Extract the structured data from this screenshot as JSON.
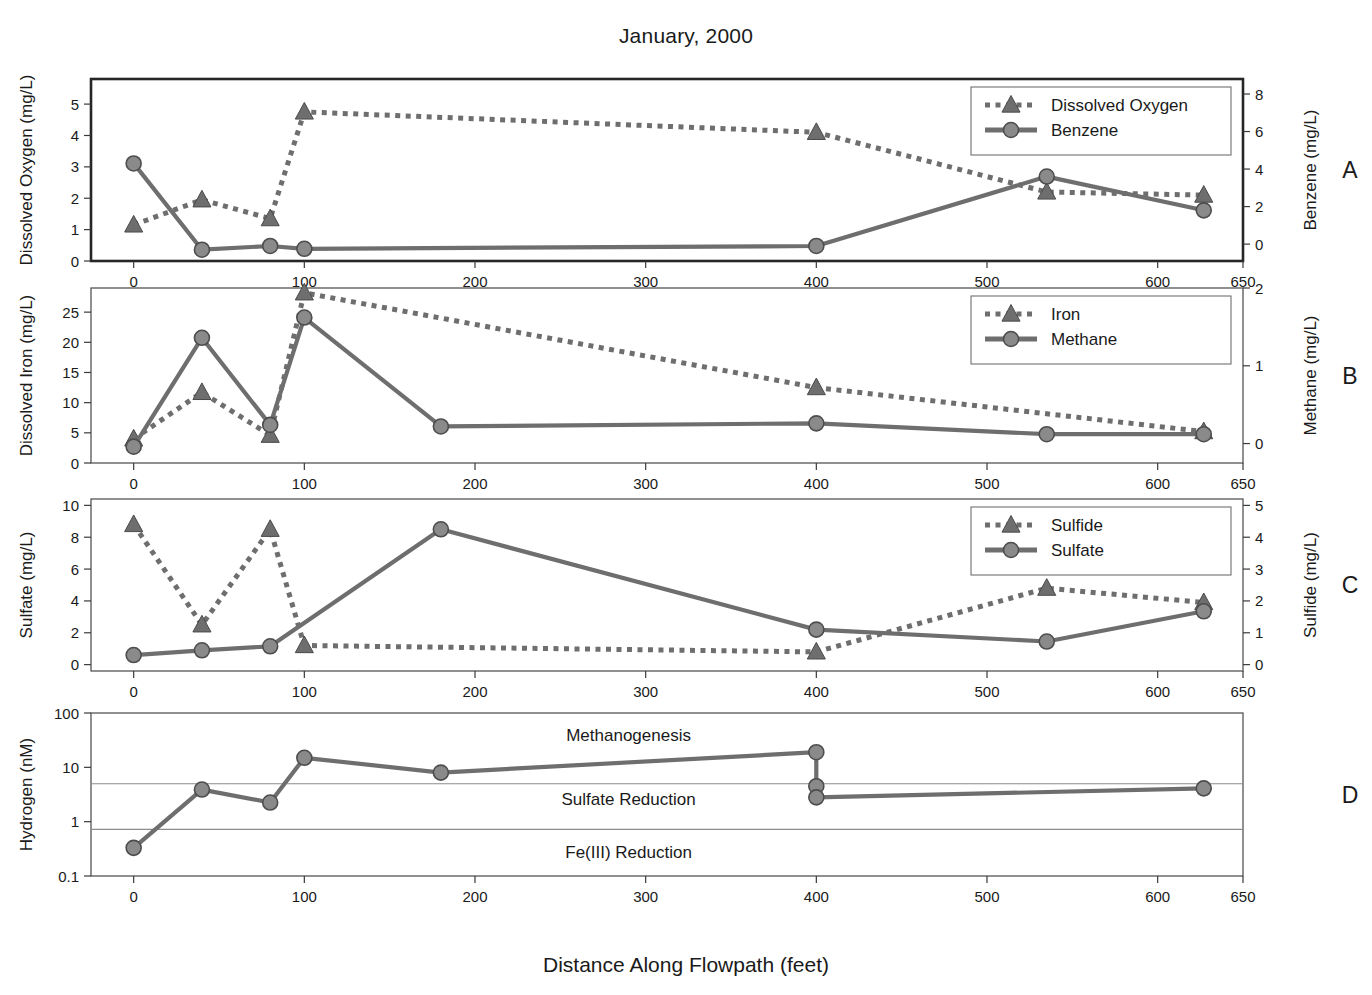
{
  "title": "January, 2000",
  "xaxis_title": "Distance Along Flowpath (feet)",
  "colors": {
    "series_gray": "#6e6e6e",
    "marker_fill": "#8a8a8a",
    "axis": "#3a3a3a",
    "frame": "#555555",
    "text": "#1a1a1a"
  },
  "x_ticks": [
    0,
    100,
    200,
    300,
    400,
    500,
    600,
    650
  ],
  "x_range": [
    -25,
    650
  ],
  "panels": [
    {
      "letter": "A",
      "left_axis_title": "Dissolved Oxygen (mg/L)",
      "right_axis_title": "Benzene (mg/L)",
      "left_ticks": [
        0,
        1,
        2,
        3,
        4,
        5
      ],
      "right_ticks": [
        0,
        2,
        4,
        6,
        8
      ],
      "legend": [
        {
          "label": "Dissolved Oxygen",
          "style": "dotted-triangle"
        },
        {
          "label": "Benzene",
          "style": "solid-circle"
        }
      ]
    },
    {
      "letter": "B",
      "left_axis_title": "Dissolved Iron (mg/L)",
      "right_axis_title": "Methane (mg/L)",
      "left_ticks": [
        0,
        5,
        10,
        15,
        20,
        25
      ],
      "right_ticks": [
        0,
        1,
        2
      ],
      "legend": [
        {
          "label": "Iron",
          "style": "dotted-triangle"
        },
        {
          "label": "Methane",
          "style": "solid-circle"
        }
      ]
    },
    {
      "letter": "C",
      "left_axis_title": "Sulfate (mg/L)",
      "right_axis_title": "Sulfide (mg/L)",
      "left_ticks": [
        0,
        2,
        4,
        6,
        8,
        10
      ],
      "right_ticks": [
        0,
        1,
        2,
        3,
        4,
        5
      ],
      "legend": [
        {
          "label": "Sulfide",
          "style": "dotted-triangle"
        },
        {
          "label": "Sulfate",
          "style": "solid-circle"
        }
      ]
    },
    {
      "letter": "D",
      "left_axis_title": "Hydrogen (nM)",
      "right_axis_title": "",
      "left_ticks": [
        0.1,
        1,
        10,
        100
      ],
      "right_ticks": [],
      "legend": [],
      "zone_labels": [
        {
          "text": "Methanogenesis",
          "x": 290,
          "y_value": 40
        },
        {
          "text": "Sulfate Reduction",
          "x": 290,
          "y_value": 2.6
        },
        {
          "text": "Fe(III) Reduction",
          "x": 290,
          "y_value": 0.28
        }
      ],
      "zone_lines": [
        5.0,
        0.72
      ]
    }
  ],
  "chart_data": [
    {
      "type": "line",
      "panel": "A",
      "title": "January, 2000",
      "xlabel": "Distance Along Flowpath (feet)",
      "ylabel": "Dissolved Oxygen (mg/L)",
      "y2label": "Benzene (mg/L)",
      "xlim": [
        -25,
        650
      ],
      "ylim": [
        0,
        5.8
      ],
      "y2lim": [
        -0.9,
        8.8
      ],
      "grid": false,
      "legend_position": "top-right",
      "series": [
        {
          "name": "Dissolved Oxygen",
          "axis": "left",
          "style": "dotted",
          "marker": "triangle",
          "x": [
            0,
            40,
            80,
            100,
            400,
            535,
            627
          ],
          "values": [
            1.15,
            1.95,
            1.35,
            4.75,
            4.1,
            2.2,
            2.1
          ]
        },
        {
          "name": "Benzene",
          "axis": "right",
          "style": "solid",
          "marker": "circle",
          "x": [
            0,
            40,
            80,
            100,
            400,
            535,
            627
          ],
          "values": [
            4.3,
            -0.3,
            -0.1,
            -0.25,
            -0.1,
            3.6,
            1.8
          ]
        }
      ]
    },
    {
      "type": "line",
      "panel": "B",
      "xlabel": "Distance Along Flowpath (feet)",
      "ylabel": "Dissolved Iron (mg/L)",
      "y2label": "Methane (mg/L)",
      "xlim": [
        -25,
        650
      ],
      "ylim": [
        0,
        29
      ],
      "y2lim": [
        -0.25,
        2.0
      ],
      "grid": false,
      "legend_position": "top-right",
      "series": [
        {
          "name": "Iron",
          "axis": "left",
          "style": "dotted",
          "marker": "triangle",
          "x": [
            0,
            40,
            80,
            100,
            400,
            627
          ],
          "values": [
            4.0,
            11.7,
            4.6,
            28.2,
            12.5,
            5.2
          ]
        },
        {
          "name": "Methane",
          "axis": "right",
          "style": "solid",
          "marker": "circle",
          "x": [
            0,
            40,
            80,
            100,
            180,
            400,
            535,
            627
          ],
          "values": [
            -0.04,
            1.36,
            0.24,
            1.62,
            0.22,
            0.26,
            0.12,
            0.12
          ]
        }
      ]
    },
    {
      "type": "line",
      "panel": "C",
      "xlabel": "Distance Along Flowpath (feet)",
      "ylabel": "Sulfate (mg/L)",
      "y2label": "Sulfide (mg/L)",
      "xlim": [
        -25,
        650
      ],
      "ylim": [
        -0.4,
        10.4
      ],
      "y2lim": [
        -0.2,
        5.2
      ],
      "grid": false,
      "legend_position": "top-right",
      "series": [
        {
          "name": "Sulfide",
          "axis": "right",
          "style": "dotted",
          "marker": "triangle",
          "x": [
            0,
            40,
            80,
            100,
            400,
            535,
            627
          ],
          "values": [
            4.4,
            1.25,
            4.25,
            0.6,
            0.4,
            2.4,
            1.95
          ]
        },
        {
          "name": "Sulfate",
          "axis": "left",
          "style": "solid",
          "marker": "circle",
          "x": [
            0,
            40,
            80,
            180,
            400,
            535,
            627
          ],
          "values": [
            0.6,
            0.9,
            1.15,
            8.5,
            2.2,
            1.45,
            3.35
          ]
        }
      ]
    },
    {
      "type": "line",
      "panel": "D",
      "xlabel": "Distance Along Flowpath (feet)",
      "ylabel": "Hydrogen (nM)",
      "xlim": [
        -25,
        650
      ],
      "ylim": [
        0.1,
        100
      ],
      "yscale": "log",
      "grid": false,
      "legend_position": "none",
      "annotations": [
        "Methanogenesis",
        "Sulfate Reduction",
        "Fe(III) Reduction"
      ],
      "series": [
        {
          "name": "Hydrogen",
          "axis": "left",
          "style": "solid",
          "marker": "circle",
          "x": [
            0,
            40,
            80,
            100,
            180,
            400,
            400,
            400,
            627
          ],
          "values": [
            0.33,
            3.9,
            2.25,
            15.0,
            8.0,
            19.0,
            4.5,
            2.8,
            4.1
          ]
        }
      ]
    }
  ]
}
